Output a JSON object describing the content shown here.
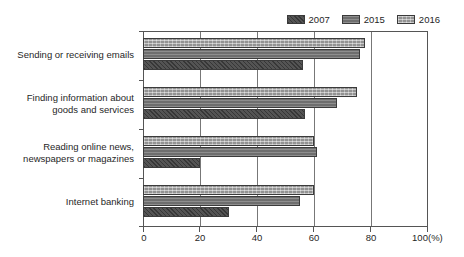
{
  "figure": {
    "title_fragment": "",
    "unit_label": "(%)"
  },
  "legend": {
    "position": "top-right",
    "items": [
      {
        "label": "2007",
        "color": "#545454",
        "pattern": "diagonal-hatch"
      },
      {
        "label": "2015",
        "color": "#6e6e6e",
        "pattern": "horizontal-line"
      },
      {
        "label": "2016",
        "color": "#a3a3a3",
        "pattern": "cross-hatch-light"
      }
    ]
  },
  "axis": {
    "x_ticks": [
      "0",
      "20",
      "40",
      "60",
      "80",
      "100"
    ],
    "x_unit": "(%)",
    "x_min": 0,
    "x_max": 100
  },
  "categories": [
    {
      "line1": "Sending or receiving emails",
      "line2": ""
    },
    {
      "line1": "Finding information about",
      "line2": "goods and services"
    },
    {
      "line1": "Reading online news,",
      "line2": "newspapers or magazines"
    },
    {
      "line1": "Internet banking",
      "line2": ""
    }
  ],
  "chart_data": {
    "type": "bar",
    "orientation": "horizontal",
    "title": "",
    "xlabel": "(%)",
    "ylabel": "",
    "xlim": [
      0,
      100
    ],
    "grid": true,
    "legend_position": "top-right",
    "categories": [
      "Sending or receiving emails",
      "Finding information about goods and services",
      "Reading online news, newspapers or magazines",
      "Internet banking"
    ],
    "series": [
      {
        "name": "2007",
        "color": "#545454",
        "values": [
          56,
          57,
          20,
          30
        ]
      },
      {
        "name": "2015",
        "color": "#6e6e6e",
        "values": [
          76,
          68,
          61,
          55
        ]
      },
      {
        "name": "2016",
        "color": "#a3a3a3",
        "values": [
          78,
          75,
          60,
          60
        ]
      }
    ]
  }
}
